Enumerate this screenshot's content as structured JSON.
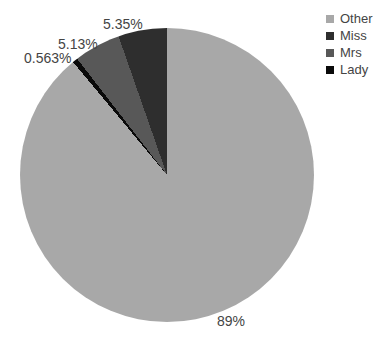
{
  "figure": {
    "background_color": "#ffffff",
    "text_color": "#444444"
  },
  "chart_data": {
    "type": "pie",
    "title": "",
    "labels": [
      "Other",
      "Miss",
      "Mrs",
      "Lady"
    ],
    "values": [
      89,
      5.35,
      5.13,
      0.563
    ],
    "percent_labels": [
      "89%",
      "5.35%",
      "5.13%",
      "0.563%"
    ],
    "colors": [
      "#a8a8a8",
      "#2e2e2e",
      "#585858",
      "#0a0a0a"
    ],
    "legend": {
      "position": "top-right",
      "entries": [
        "Other",
        "Miss",
        "Mrs",
        "Lady"
      ]
    },
    "layout_hints": {
      "start_angle": "12-oclock",
      "direction": "counterclockwise",
      "sorted_descending": true,
      "label_position": "outside",
      "grid": false
    }
  }
}
